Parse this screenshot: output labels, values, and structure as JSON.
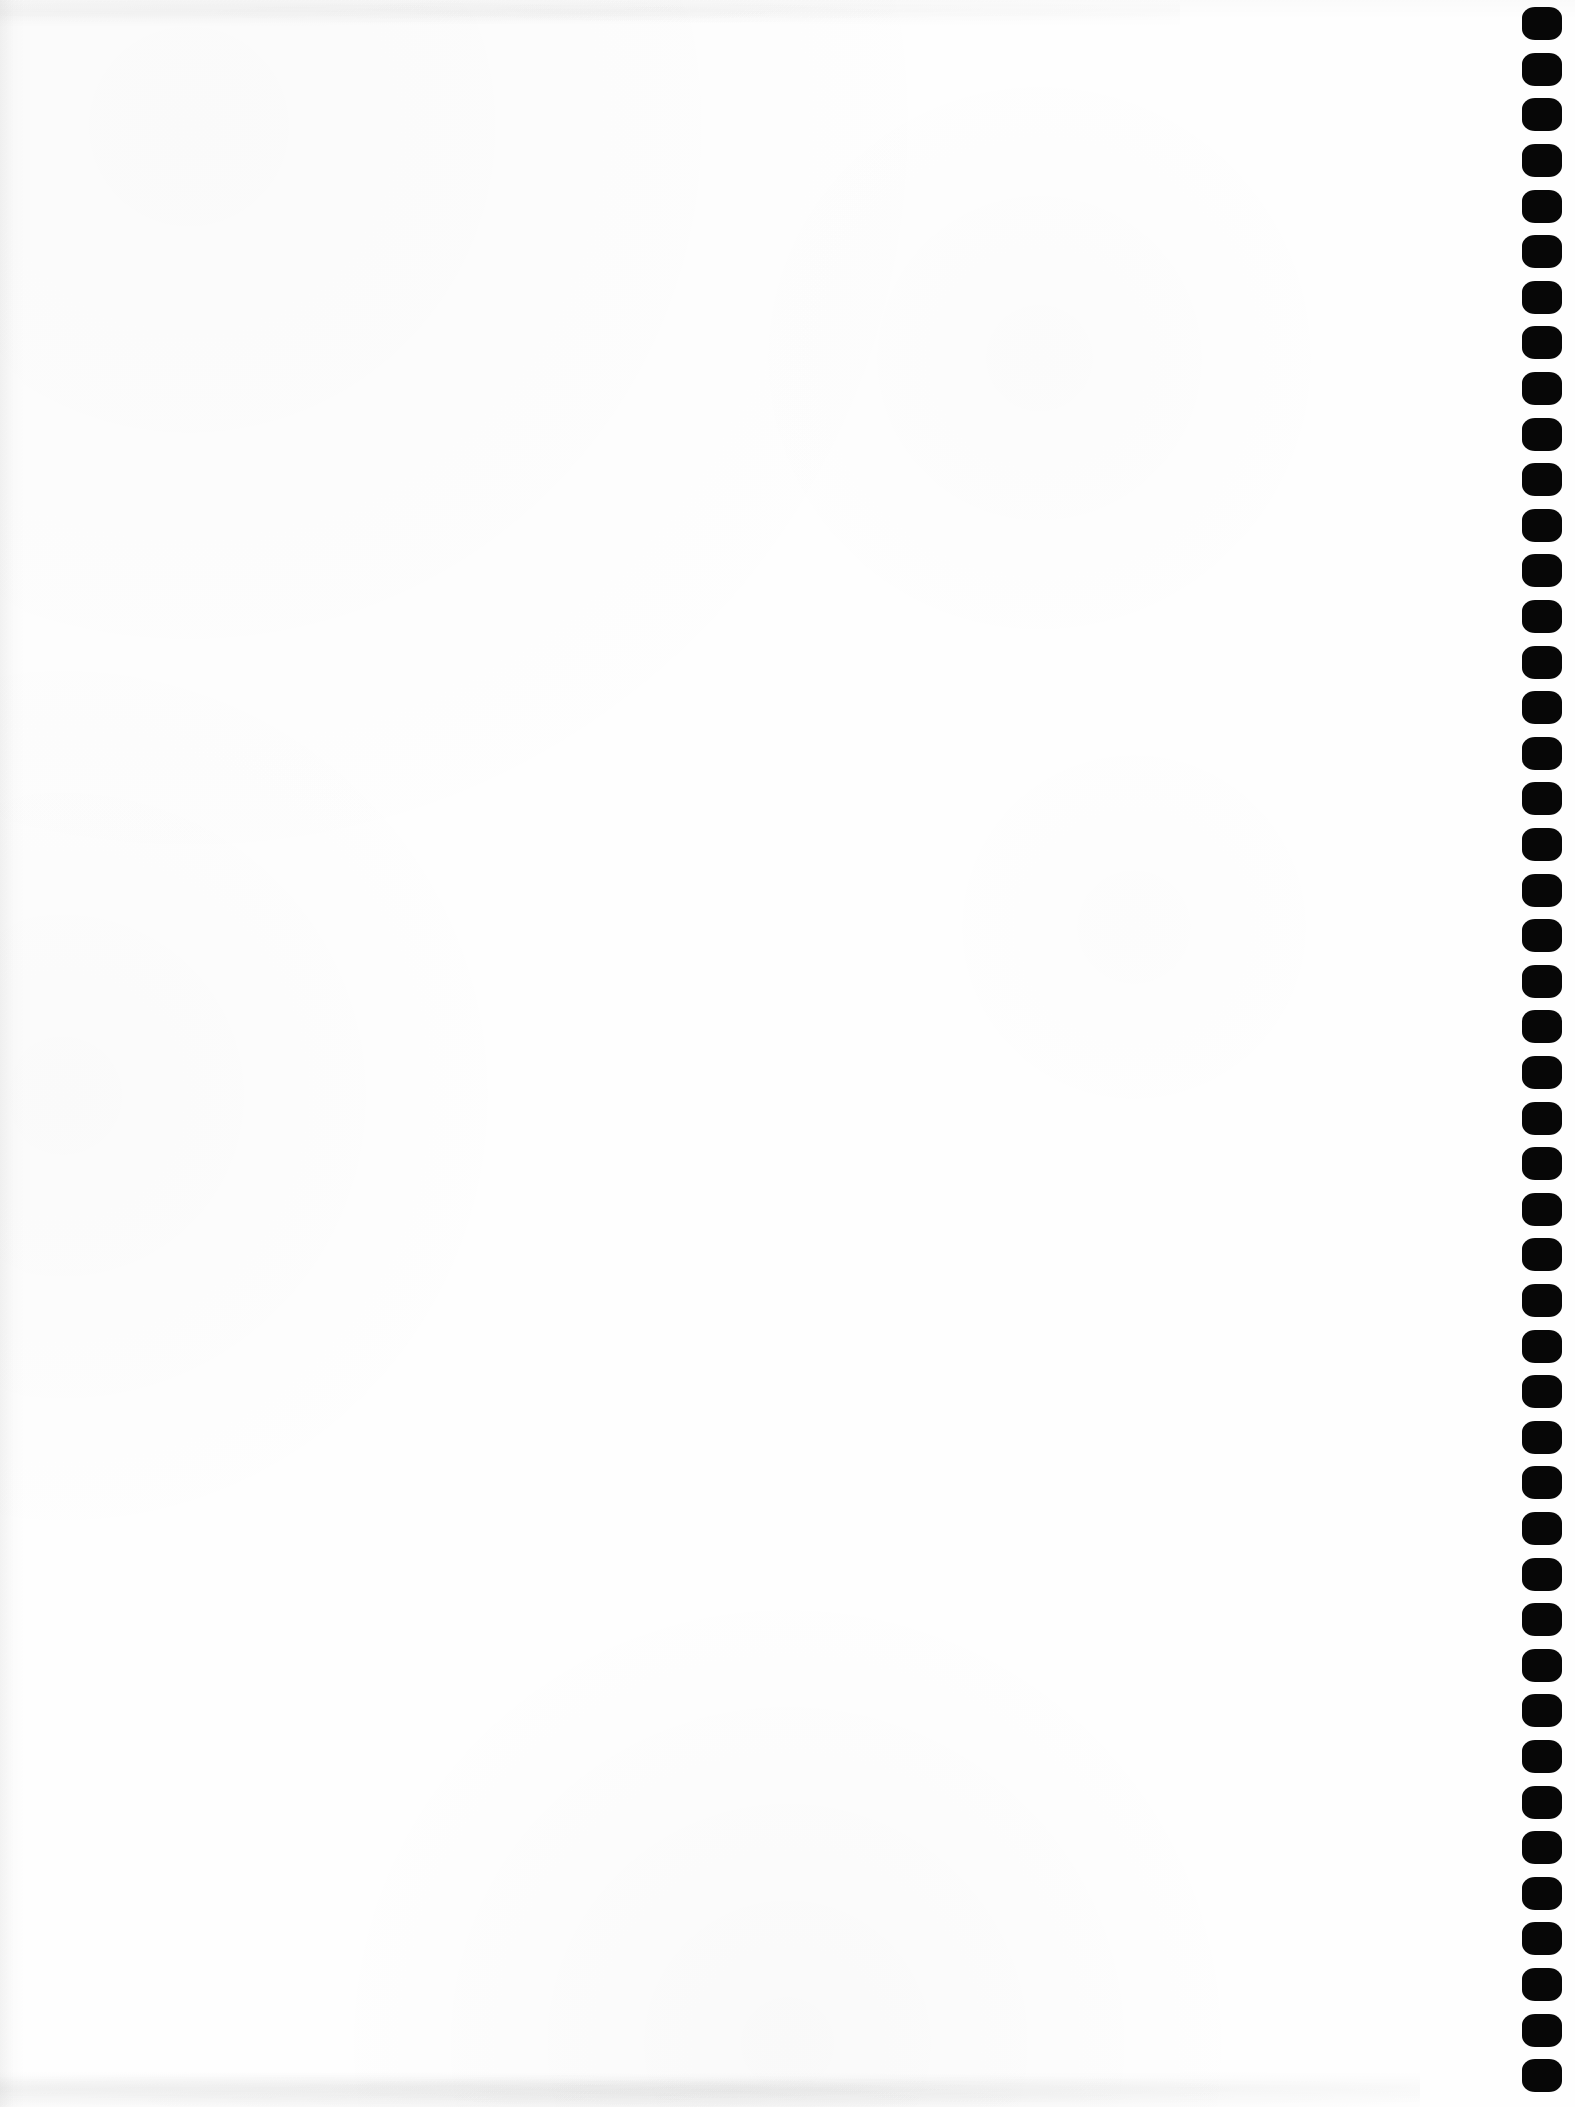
{
  "document": {
    "kind": "scanned-blank-page",
    "page_width_px": 1575,
    "page_height_px": 2107,
    "paper_color": "#fefefe",
    "body_text": "",
    "body_note": "blank page — no printed text, headings, figures or tables are visible"
  },
  "edge_marks": {
    "name": "punch-hole-mark-column",
    "description": "vertical run of solid black octagonal marks along the right edge of the scanned sheet",
    "color": "#070707",
    "edge": "right",
    "count": 46,
    "mark_width_px": 40,
    "mark_height_px": 33,
    "pitch_px": 45.6,
    "column_left_px": 1522,
    "first_mark_center_y_px": 23,
    "marks": [
      {
        "index": 1,
        "center_y": 23
      },
      {
        "index": 2,
        "center_y": 69
      },
      {
        "index": 3,
        "center_y": 114
      },
      {
        "index": 4,
        "center_y": 160
      },
      {
        "index": 5,
        "center_y": 206
      },
      {
        "index": 6,
        "center_y": 251
      },
      {
        "index": 7,
        "center_y": 297
      },
      {
        "index": 8,
        "center_y": 342
      },
      {
        "index": 9,
        "center_y": 388
      },
      {
        "index": 10,
        "center_y": 434
      },
      {
        "index": 11,
        "center_y": 479
      },
      {
        "index": 12,
        "center_y": 525
      },
      {
        "index": 13,
        "center_y": 570
      },
      {
        "index": 14,
        "center_y": 616
      },
      {
        "index": 15,
        "center_y": 662
      },
      {
        "index": 16,
        "center_y": 707
      },
      {
        "index": 17,
        "center_y": 753
      },
      {
        "index": 18,
        "center_y": 798
      },
      {
        "index": 19,
        "center_y": 844
      },
      {
        "index": 20,
        "center_y": 890
      },
      {
        "index": 21,
        "center_y": 935
      },
      {
        "index": 22,
        "center_y": 981
      },
      {
        "index": 23,
        "center_y": 1026
      },
      {
        "index": 24,
        "center_y": 1072
      },
      {
        "index": 25,
        "center_y": 1118
      },
      {
        "index": 26,
        "center_y": 1163
      },
      {
        "index": 27,
        "center_y": 1209
      },
      {
        "index": 28,
        "center_y": 1254
      },
      {
        "index": 29,
        "center_y": 1300
      },
      {
        "index": 30,
        "center_y": 1346
      },
      {
        "index": 31,
        "center_y": 1391
      },
      {
        "index": 32,
        "center_y": 1437
      },
      {
        "index": 33,
        "center_y": 1482
      },
      {
        "index": 34,
        "center_y": 1528
      },
      {
        "index": 35,
        "center_y": 1574
      },
      {
        "index": 36,
        "center_y": 1619
      },
      {
        "index": 37,
        "center_y": 1665
      },
      {
        "index": 38,
        "center_y": 1710
      },
      {
        "index": 39,
        "center_y": 1756
      },
      {
        "index": 40,
        "center_y": 1802
      },
      {
        "index": 41,
        "center_y": 1847
      },
      {
        "index": 42,
        "center_y": 1893
      },
      {
        "index": 43,
        "center_y": 1938
      },
      {
        "index": 44,
        "center_y": 1984
      },
      {
        "index": 45,
        "center_y": 2030
      },
      {
        "index": 46,
        "center_y": 2075
      }
    ]
  },
  "scan_artifacts": {
    "top_band": "faint grey speckle along the head of the sheet",
    "bottom_band": "faint grey speckle along the foot of the sheet",
    "left_gutter": "faint grey shadow along the left edge from the scanner bed"
  }
}
